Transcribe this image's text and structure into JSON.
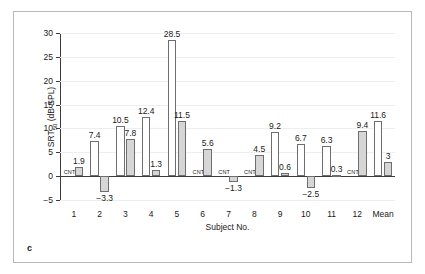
{
  "figure": {
    "panel_label": "c"
  },
  "chart_data": {
    "type": "bar",
    "title": "",
    "xlabel": "Subject No.",
    "ylabel": "SRT50 (dB SPL)",
    "ylabel_base": "SRT",
    "ylabel_sub": "50",
    "ylabel_unit": " (dB SPL)",
    "ylim": [
      -5,
      30
    ],
    "yticks": [
      -5,
      0,
      5,
      10,
      15,
      20,
      25,
      30
    ],
    "ytick_labels": [
      "−5",
      "0",
      "5",
      "10",
      "15",
      "20",
      "25",
      "30"
    ],
    "grid": true,
    "legend": "none",
    "categories": [
      "1",
      "2",
      "3",
      "4",
      "5",
      "6",
      "7",
      "8",
      "9",
      "10",
      "11",
      "12",
      "Mean"
    ],
    "not_tested_marker": "CNT",
    "series": [
      {
        "name": "open",
        "style": "white-bar",
        "values": [
          null,
          7.4,
          10.5,
          12.4,
          28.5,
          null,
          null,
          null,
          9.2,
          6.7,
          6.3,
          null,
          11.6
        ],
        "labels": [
          "CNT",
          "7.4",
          "10.5",
          "12.4",
          "28.5",
          "CNT",
          "CNT",
          "CNT",
          "9.2",
          "6.7",
          "6.3",
          "CNT",
          "11.6"
        ]
      },
      {
        "name": "filled",
        "style": "gray-bar",
        "values": [
          1.9,
          -3.3,
          7.8,
          1.3,
          11.5,
          5.6,
          -1.3,
          4.5,
          0.6,
          -2.5,
          0.3,
          9.4,
          3
        ],
        "labels": [
          "1.9",
          "−3.3",
          "7.8",
          "1.3",
          "11.5",
          "5.6",
          "−1.3",
          "4.5",
          "0.6",
          "−2.5",
          "0.3",
          "9.4",
          "3"
        ]
      }
    ]
  },
  "colors": {
    "bar_fill_gray": "#d6d6d6",
    "bar_fill_white": "#ffffff",
    "bar_border": "#6e6e6e",
    "axis": "#3c3c3c",
    "grid": "#eeeeee",
    "frame": "#b9b9b9",
    "text": "#1a1a1a"
  }
}
